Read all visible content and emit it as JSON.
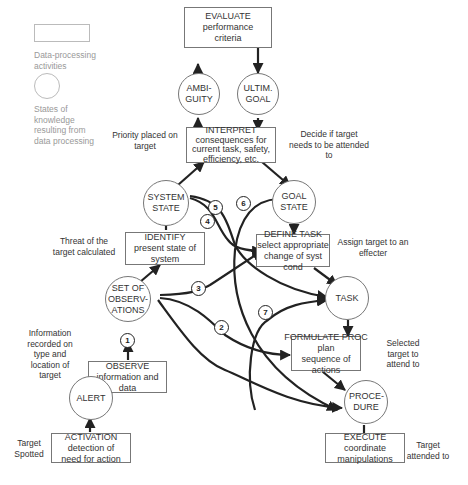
{
  "legend": {
    "box_label": "Data-processing activities",
    "circle_label": "States of knowledge resulting from data processing"
  },
  "activities": {
    "evaluate": {
      "title": "EVALUATE",
      "desc": "performance criteria"
    },
    "interpret": {
      "title": "INTERPRET",
      "desc": "consequences for current task, safety, efficiency, etc."
    },
    "identify": {
      "title": "IDENTIFY",
      "desc": "present state of system"
    },
    "define_task": {
      "title": "DEFINE TASK",
      "desc": "select appropriate change of syst cond"
    },
    "observe": {
      "title": "OBSERVE",
      "desc": "information and data"
    },
    "formulate_proc": {
      "title": "FORMULATE PROC",
      "desc": "plan sequence of actions"
    },
    "activation": {
      "title": "ACTIVATION",
      "desc": "detection of need for action"
    },
    "execute": {
      "title": "EXECUTE",
      "desc": "coordinate manipulations"
    }
  },
  "states": {
    "ambiguity": "AMBI- GUITY",
    "ultim_goal": "ULTIM. GOAL",
    "system_state": "SYSTEM STATE",
    "goal_state": "GOAL STATE",
    "set_of_observations": "SET OF OBSERV- ATIONS",
    "task": "TASK",
    "alert": "ALERT",
    "procedure": "PROCE- DURE"
  },
  "annotations": {
    "priority": "Priority placed on target",
    "decide": "Decide if target needs to be attended to",
    "threat": "Threat of the target calculated",
    "assign": "Assign target to an effecter",
    "information": "Information recorded on type and location of target",
    "selected": "Selected target to attend to",
    "spotted": "Target Spotted",
    "attended": "Target attended to"
  },
  "shortcuts": [
    "1",
    "2",
    "3",
    "4",
    "5",
    "6",
    "7"
  ]
}
